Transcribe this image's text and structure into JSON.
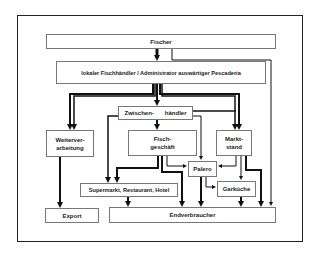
{
  "diagram": {
    "type": "flowchart",
    "nodes": {
      "fischer": "Fischer",
      "fischhaendler": "lokaler Fischhändler / Administrator auswärtiger Pescaderia",
      "zwischenhaendler_a": "Zwischen-",
      "zwischenhaendler_b": "händler",
      "weiterverarbeitung": "Weiterver-\narbeitung",
      "fischgeschaeft": "Fisch-\ngeschäft",
      "marktstand": "Markt-\nstand",
      "palero": "Palero",
      "garkueche": "Garküche",
      "supermarkt": "Supermarkt, Restaurant, Hotel",
      "export": "Export",
      "endverbraucher": "Endverbraucher"
    },
    "edges": [
      {
        "from": "Fischer",
        "to": "lokaler Fischhändler",
        "weight": "thick"
      },
      {
        "from": "Fischer",
        "to": "Endverbraucher",
        "weight": "thin"
      },
      {
        "from": "lokaler Fischhändler",
        "to": "Zwischenhändler",
        "weight": "thick"
      },
      {
        "from": "lokaler Fischhändler",
        "to": "Weiterverarbeitung",
        "weight": "thick-double"
      },
      {
        "from": "lokaler Fischhändler",
        "to": "Marktstand",
        "weight": "thick-double"
      },
      {
        "from": "Zwischenhändler",
        "to": "Weiterverarbeitung",
        "weight": "thick"
      },
      {
        "from": "Zwischenhändler",
        "to": "Fischgeschäft",
        "weight": "thick"
      },
      {
        "from": "Zwischenhändler",
        "to": "Marktstand",
        "weight": "thick"
      },
      {
        "from": "Zwischenhändler",
        "to": "Supermarkt, Restaurant, Hotel",
        "weight": "thick"
      },
      {
        "from": "Zwischenhändler",
        "to": "Palero",
        "weight": "thin"
      },
      {
        "from": "Weiterverarbeitung",
        "to": "Export",
        "weight": "thick"
      },
      {
        "from": "Fischgeschäft",
        "to": "Supermarkt, Restaurant, Hotel",
        "weight": "thick"
      },
      {
        "from": "Fischgeschäft",
        "to": "Endverbraucher",
        "weight": "thick"
      },
      {
        "from": "Fischgeschäft",
        "to": "Palero",
        "weight": "thin"
      },
      {
        "from": "Marktstand",
        "to": "Palero",
        "weight": "thin"
      },
      {
        "from": "Marktstand",
        "to": "Garküche",
        "weight": "thin"
      },
      {
        "from": "Marktstand",
        "to": "Endverbraucher",
        "weight": "thick"
      },
      {
        "from": "Palero",
        "to": "Endverbraucher",
        "weight": "thick"
      },
      {
        "from": "Palero",
        "to": "Garküche",
        "weight": "thin"
      },
      {
        "from": "Garküche",
        "to": "Endverbraucher",
        "weight": "thick"
      },
      {
        "from": "Supermarkt, Restaurant, Hotel",
        "to": "Endverbraucher",
        "weight": "thick"
      }
    ]
  }
}
